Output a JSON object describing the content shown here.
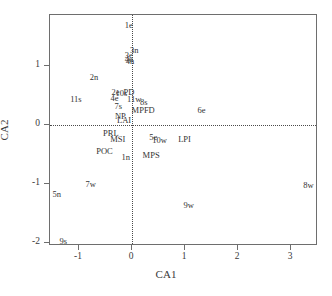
{
  "chart_data": {
    "type": "scatter",
    "title": "",
    "xlabel": "CA1",
    "ylabel": "CA2",
    "xlim": [
      -1.55,
      3.5
    ],
    "ylim": [
      -2.38,
      1.92
    ],
    "xticks": [
      -1,
      0,
      1,
      2,
      3
    ],
    "xticklabels": [
      "-1",
      "0",
      "1",
      "2",
      "3"
    ],
    "yticks": [
      1,
      0,
      -1,
      -2
    ],
    "yticklabels": [
      "1",
      "0",
      "-1",
      "-2"
    ],
    "grid": false,
    "legend": null,
    "reference_lines": [
      {
        "axis": "horizontal",
        "value": 0,
        "style": "dotted"
      },
      {
        "axis": "vertical",
        "value": 0,
        "style": "dotted"
      }
    ],
    "point_label_style": "text-only",
    "points": [
      {
        "label": "1e",
        "x": -0.04,
        "y": 1.68
      },
      {
        "label": "3n",
        "x": 0.06,
        "y": 1.26
      },
      {
        "label": "3e",
        "x": -0.04,
        "y": 1.17
      },
      {
        "label": "4e",
        "x": -0.04,
        "y": 1.1
      },
      {
        "label": "4n",
        "x": -0.02,
        "y": 1.06
      },
      {
        "label": "2n",
        "x": -0.7,
        "y": 0.79
      },
      {
        "label": "2e",
        "x": -0.29,
        "y": 0.55
      },
      {
        "label": "10s",
        "x": -0.18,
        "y": 0.53
      },
      {
        "label": "PD",
        "x": -0.04,
        "y": 0.55
      },
      {
        "label": "11s",
        "x": -1.04,
        "y": 0.43
      },
      {
        "label": "4e",
        "x": -0.31,
        "y": 0.44
      },
      {
        "label": "11w",
        "x": 0.06,
        "y": 0.42
      },
      {
        "label": "8s",
        "x": 0.24,
        "y": 0.38
      },
      {
        "label": "7s",
        "x": -0.24,
        "y": 0.31
      },
      {
        "label": "MPFD",
        "x": 0.23,
        "y": 0.24
      },
      {
        "label": "6e",
        "x": 1.33,
        "y": 0.24
      },
      {
        "label": "NP",
        "x": -0.2,
        "y": 0.14
      },
      {
        "label": "LAI",
        "x": -0.13,
        "y": 0.06
      },
      {
        "label": "PRL",
        "x": -0.38,
        "y": -0.15
      },
      {
        "label": "MSI",
        "x": -0.25,
        "y": -0.26
      },
      {
        "label": "5e",
        "x": 0.42,
        "y": -0.22
      },
      {
        "label": "10w",
        "x": 0.54,
        "y": -0.27
      },
      {
        "label": "LPI",
        "x": 1.01,
        "y": -0.25
      },
      {
        "label": "POC",
        "x": -0.5,
        "y": -0.46
      },
      {
        "label": "1n",
        "x": -0.1,
        "y": -0.56
      },
      {
        "label": "MPS",
        "x": 0.38,
        "y": -0.53
      },
      {
        "label": "7w",
        "x": -0.76,
        "y": -1.02
      },
      {
        "label": "8w",
        "x": 3.35,
        "y": -1.03
      },
      {
        "label": "5n",
        "x": -1.4,
        "y": -1.18
      },
      {
        "label": "9w",
        "x": 1.09,
        "y": -1.37
      },
      {
        "label": "9s",
        "x": -1.28,
        "y": -1.99
      }
    ]
  }
}
